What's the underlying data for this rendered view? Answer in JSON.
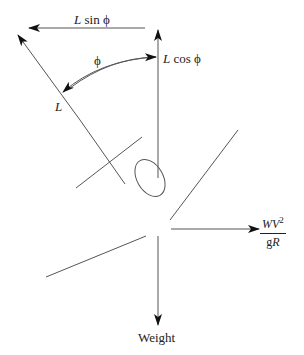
{
  "diagram": {
    "labels": {
      "l_sin_phi_var": "L",
      "l_sin_phi_func": " sin ϕ",
      "l_cos_phi_var": "L",
      "l_cos_phi_func": " cos ϕ",
      "phi": "ϕ",
      "lift": "L",
      "centrifugal_num": "WV",
      "centrifugal_num_exp": "2",
      "centrifugal_den_g": "g",
      "centrifugal_den_r": "R",
      "weight": "Weight"
    },
    "vectors": [
      {
        "name": "L sin ϕ",
        "direction": "left",
        "horizontal_component": true
      },
      {
        "name": "L cos ϕ",
        "direction": "up",
        "vertical_component": true
      },
      {
        "name": "L",
        "direction": "up-left",
        "tilted_by": "ϕ"
      },
      {
        "name": "WV²/gR",
        "direction": "right"
      },
      {
        "name": "Weight",
        "direction": "down"
      }
    ],
    "colors": {
      "line": "#555555",
      "text": "#222222"
    }
  }
}
